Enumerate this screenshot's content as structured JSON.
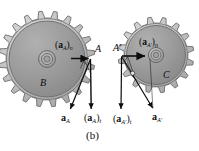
{
  "figure": {
    "caption": "(b)",
    "background_color": "#ffffff",
    "line_color": "#0d0d0d",
    "gear_body_color": "#999999",
    "gear_rim_color": "#b3b3b3",
    "gear_teeth_color": "#c9c9c9",
    "gear_edge_color": "#6e6e6e",
    "hub_color": "#a8a8a8"
  },
  "left_gear": {
    "name": "gear-B",
    "center_label": "B",
    "contact_point_label": "A",
    "teeth": 20,
    "center_x": 47,
    "center_y": 59,
    "outer_radius": 48,
    "root_radius": 41,
    "body_radius": 39,
    "hub_outer_radius": 8,
    "hub_inner_radius": 4,
    "normal_accel_label_main": "a",
    "normal_accel_label_sub_main": "A",
    "normal_accel_label_sub_comp": "n",
    "tangential_accel_label_sub_comp": "t",
    "total_accel_label": "a",
    "total_accel_sub": "A"
  },
  "right_gear": {
    "name": "gear-C",
    "center_label": "C",
    "contact_point_label": "A'",
    "teeth": 16,
    "center_x": 156,
    "center_y": 55,
    "outer_radius": 38,
    "root_radius": 32,
    "body_radius": 30,
    "hub_outer_radius": 7,
    "hub_inner_radius": 3.5,
    "normal_accel_label_main": "a",
    "normal_accel_label_sub_main": "A'",
    "normal_accel_label_sub_comp": "n",
    "tangential_accel_label_sub_comp": "t",
    "total_accel_label": "a",
    "total_accel_sub": "A'"
  },
  "labels": {
    "point_A": "A",
    "point_A_prime": "A'",
    "gear_B": "B",
    "gear_C": "C",
    "accel_normal_A": "(aA)n",
    "accel_normal_A_prime": "(aA')n",
    "accel_total_A": "aA",
    "accel_tangential_A": "(aA)t",
    "accel_tangential_A_prime": "(aA')t",
    "accel_total_A_prime": "aA'",
    "caption": "(b)"
  },
  "vectors": {
    "left": {
      "normal": {
        "from_x": 70,
        "from_y": 58,
        "to_x": 90,
        "to_y": 58,
        "label": "(aA)n"
      },
      "tangential": {
        "from_x": 90,
        "from_y": 58,
        "to_x": 91,
        "to_y": 110,
        "label": "(aA)t"
      },
      "total": {
        "from_x": 90,
        "from_y": 58,
        "to_x": 70,
        "to_y": 110,
        "label": "aA"
      }
    },
    "right": {
      "normal": {
        "from_x": 122,
        "from_y": 56,
        "to_x": 146,
        "to_y": 56,
        "label": "(aA')n"
      },
      "tangential": {
        "from_x": 122,
        "from_y": 56,
        "to_x": 121,
        "to_y": 110,
        "label": "(aA')t"
      },
      "total": {
        "from_x": 122,
        "from_y": 56,
        "to_x": 152,
        "to_y": 110,
        "label": "aA'"
      }
    }
  }
}
